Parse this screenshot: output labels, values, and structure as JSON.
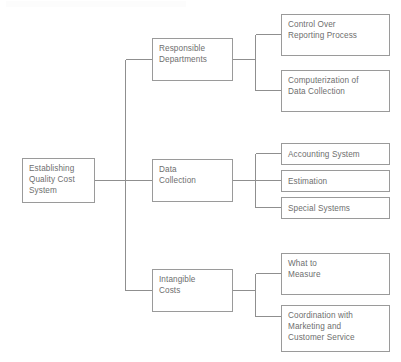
{
  "diagram": {
    "title": "Establishing Quality Cost System",
    "type": "tree",
    "orientation": "left-to-right",
    "colors": {
      "box_border": "#9a9a9a",
      "text": "#6e6e6e",
      "connector": "#8f8f8f",
      "background": "#ffffff"
    },
    "root": {
      "label": "Establishing\nQuality Cost\nSystem"
    },
    "branches": [
      {
        "label": "Responsible\nDepartments",
        "children": [
          {
            "label": "Control Over\nReporting Process"
          },
          {
            "label": "Computerization of\nData Collection"
          }
        ]
      },
      {
        "label": "Data\nCollection",
        "children": [
          {
            "label": "Accounting System"
          },
          {
            "label": "Estimation"
          },
          {
            "label": "Special Systems"
          }
        ]
      },
      {
        "label": "Intangible\nCosts",
        "children": [
          {
            "label": "What to\nMeasure"
          },
          {
            "label": "Coordination with\nMarketing and\nCustomer Service"
          }
        ]
      }
    ]
  }
}
